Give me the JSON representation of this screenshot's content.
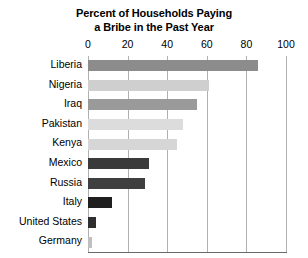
{
  "chart_data": {
    "type": "bar",
    "orientation": "horizontal",
    "title": "Percent of Households Paying a Bribe in the Past Year",
    "title_lines": [
      "Percent of Households Paying",
      "a Bribe in the Past Year"
    ],
    "xlabel": "",
    "ylabel": "",
    "xlim": [
      0,
      100
    ],
    "xticks": [
      0,
      20,
      40,
      60,
      80,
      100
    ],
    "xtick_labels": [
      "0",
      "20",
      "40",
      "60",
      "80",
      "100"
    ],
    "grid": "vertical",
    "legend": "none",
    "categories": [
      "Liberia",
      "Nigeria",
      "Iraq",
      "Pakistan",
      "Kenya",
      "Mexico",
      "Russia",
      "Italy",
      "United States",
      "Germany"
    ],
    "values": [
      86,
      61,
      55,
      48,
      45,
      31,
      29,
      12,
      4,
      2
    ],
    "bar_colors": [
      "#8c8c8c",
      "#cfcfcf",
      "#9a9a9a",
      "#dcdcdc",
      "#d6d6d6",
      "#3a3a3a",
      "#3f3f3f",
      "#1f1f1f",
      "#2e2e2e",
      "#bfbfbf"
    ],
    "bars": [
      {
        "category": "Liberia",
        "value": 86,
        "color": "#8c8c8c"
      },
      {
        "category": "Nigeria",
        "value": 61,
        "color": "#cfcfcf"
      },
      {
        "category": "Iraq",
        "value": 55,
        "color": "#9a9a9a"
      },
      {
        "category": "Pakistan",
        "value": 48,
        "color": "#dcdcdc"
      },
      {
        "category": "Kenya",
        "value": 45,
        "color": "#d6d6d6"
      },
      {
        "category": "Mexico",
        "value": 31,
        "color": "#3a3a3a"
      },
      {
        "category": "Russia",
        "value": 29,
        "color": "#3f3f3f"
      },
      {
        "category": "Italy",
        "value": 12,
        "color": "#1f1f1f"
      },
      {
        "category": "United States",
        "value": 4,
        "color": "#2e2e2e"
      },
      {
        "category": "Germany",
        "value": 2,
        "color": "#bfbfbf"
      }
    ],
    "gridline_color": "#b0b0b0",
    "axis_rule_color": "#6a6a6a",
    "background_color": "#ffffff",
    "text_color": "#000000"
  }
}
